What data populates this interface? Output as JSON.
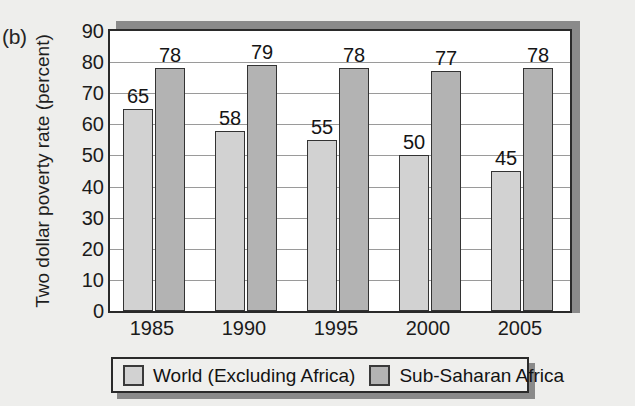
{
  "panel": {
    "letter": "(b)"
  },
  "chart_data": {
    "type": "bar",
    "title": "",
    "subtitle": "",
    "xlabel": "",
    "ylabel": "Two dollar poverty rate (percent)",
    "categories": [
      "1985",
      "1990",
      "1995",
      "2000",
      "2005"
    ],
    "series": [
      {
        "name": "World (Excluding Africa)",
        "color": "#d2d2d2",
        "values": [
          65,
          58,
          55,
          50,
          45
        ]
      },
      {
        "name": "Sub-Saharan Africa",
        "color": "#b3b3b3",
        "values": [
          78,
          79,
          78,
          77,
          78
        ]
      }
    ],
    "ylim": [
      0,
      90
    ],
    "ytick_values": [
      0,
      10,
      20,
      30,
      40,
      50,
      60,
      70,
      80,
      90
    ],
    "ytick_labels": [
      "0",
      "10",
      "20",
      "30",
      "40",
      "50",
      "60",
      "70",
      "80",
      "90"
    ],
    "grid": true,
    "grid_axis": "y",
    "legend_position": "bottom",
    "data_labels": true
  },
  "legend": {
    "items": [
      {
        "label": "World (Excluding Africa)",
        "swatch": "series0"
      },
      {
        "label": "Sub-Saharan Africa",
        "swatch": "series1"
      }
    ]
  },
  "colors": {
    "background": "#eeeeec",
    "plot_background": "#ffffff",
    "axis": "#2a2a2a",
    "gridline": "#9a9a9a",
    "shadow": "#8a8a8a",
    "series0": "#d2d2d2",
    "series1": "#b3b3b3"
  }
}
